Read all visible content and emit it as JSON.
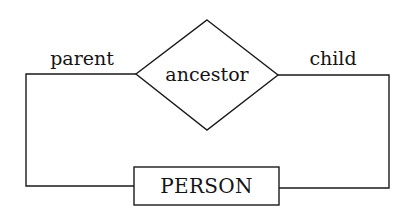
{
  "diagram": {
    "type": "entity-relationship",
    "relationship": {
      "name": "ancestor",
      "shape": "diamond"
    },
    "entity": {
      "name": "PERSON",
      "shape": "rectangle"
    },
    "roles": {
      "left": "parent",
      "right": "child"
    },
    "colors": {
      "stroke": "#1a1a1a",
      "text": "#141414",
      "background": "#ffffff"
    }
  }
}
